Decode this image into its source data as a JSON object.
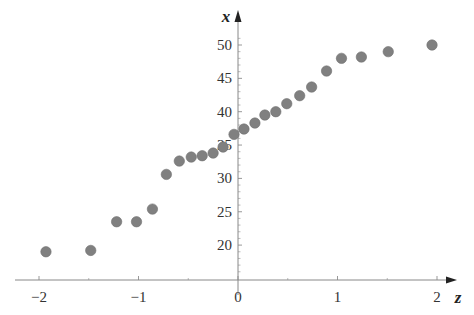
{
  "chart_data": {
    "type": "scatter",
    "title": "",
    "xlabel": "z",
    "ylabel": "x",
    "xlim": [
      -2.25,
      2.2
    ],
    "ylim": [
      15,
      52
    ],
    "x_ticks": [
      -2,
      -1,
      0,
      1,
      2
    ],
    "x_tick_labels": [
      "−2",
      "−1",
      "0",
      "1",
      "2"
    ],
    "y_ticks": [
      20,
      25,
      30,
      35,
      40,
      45,
      50
    ],
    "y_tick_labels": [
      "20",
      "25",
      "30",
      "35",
      "40",
      "45",
      "50"
    ],
    "grid": false,
    "legend": null,
    "marker_color": "#808080",
    "series": [
      {
        "name": "points",
        "points": [
          {
            "z": -1.93,
            "x": 19.0
          },
          {
            "z": -1.48,
            "x": 19.2
          },
          {
            "z": -1.22,
            "x": 23.5
          },
          {
            "z": -1.02,
            "x": 23.5
          },
          {
            "z": -0.86,
            "x": 25.4
          },
          {
            "z": -0.72,
            "x": 30.6
          },
          {
            "z": -0.59,
            "x": 32.6
          },
          {
            "z": -0.47,
            "x": 33.2
          },
          {
            "z": -0.36,
            "x": 33.4
          },
          {
            "z": -0.25,
            "x": 33.8
          },
          {
            "z": -0.15,
            "x": 34.7
          },
          {
            "z": -0.04,
            "x": 36.6
          },
          {
            "z": 0.06,
            "x": 37.4
          },
          {
            "z": 0.17,
            "x": 38.3
          },
          {
            "z": 0.27,
            "x": 39.5
          },
          {
            "z": 0.38,
            "x": 40.0
          },
          {
            "z": 0.49,
            "x": 41.2
          },
          {
            "z": 0.62,
            "x": 42.4
          },
          {
            "z": 0.74,
            "x": 43.7
          },
          {
            "z": 0.89,
            "x": 46.1
          },
          {
            "z": 1.04,
            "x": 48.0
          },
          {
            "z": 1.24,
            "x": 48.2
          },
          {
            "z": 1.51,
            "x": 49.0
          },
          {
            "z": 1.95,
            "x": 50.0
          }
        ]
      }
    ]
  }
}
